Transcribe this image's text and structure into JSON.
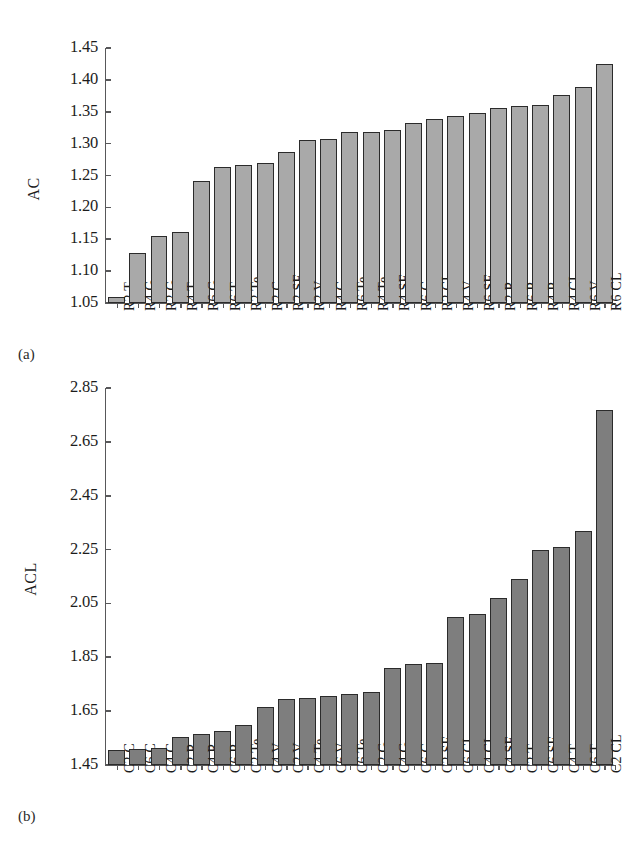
{
  "figure": {
    "panel_a_label": "(a)",
    "panel_b_label": "(b)",
    "bar_fill_a": "#a9a9a9",
    "bar_fill_b": "#7e7e7e",
    "bar_edge": "#2b2b2b",
    "axis_color": "#58585a"
  },
  "chart_data": [
    {
      "type": "bar",
      "title": "",
      "panel": "(a)",
      "xlabel": "",
      "ylabel": "AC",
      "ylim": [
        1.05,
        1.45
      ],
      "yticks": [
        "1.05",
        "1.10",
        "1.15",
        "1.20",
        "1.25",
        "1.30",
        "1.35",
        "1.40",
        "1.45"
      ],
      "grid": false,
      "legend": "none",
      "categories": [
        "R2 T",
        "R4 G",
        "R2 G",
        "R4 T",
        "R6 G",
        "R6 T",
        "R2 Te",
        "R2 C",
        "R2 SF",
        "R2 V",
        "R4 C",
        "R6 Te",
        "R4 Te",
        "R4 SF",
        "R6 C",
        "R2 CL",
        "R4 V",
        "R6 SF",
        "R2 R",
        "R6 R",
        "R4 R",
        "R4 CL",
        "R6 V",
        "R6 CL"
      ],
      "values": [
        1.06,
        1.128,
        1.155,
        1.161,
        1.241,
        1.263,
        1.266,
        1.269,
        1.287,
        1.305,
        1.307,
        1.318,
        1.319,
        1.321,
        1.333,
        1.339,
        1.344,
        1.348,
        1.356,
        1.359,
        1.361,
        1.376,
        1.389,
        1.425
      ]
    },
    {
      "type": "bar",
      "title": "",
      "panel": "(b)",
      "xlabel": "",
      "ylabel": "ACL",
      "ylim": [
        1.45,
        2.85
      ],
      "yticks": [
        "1.45",
        "1.65",
        "1.85",
        "2.05",
        "2.25",
        "2.45",
        "2.65",
        "2.85"
      ],
      "grid": false,
      "legend": "none",
      "categories": [
        "C2 C",
        "C6 C",
        "C4 C",
        "C2 R",
        "C4 R",
        "C6 R",
        "C2 Te",
        "C4 V",
        "C2 V",
        "C4 Te",
        "C6 V",
        "C6 Te",
        "C2 G",
        "C4 G",
        "C6 G",
        "C2 SF",
        "C6 CL",
        "C4 CL",
        "C4 SF",
        "C2 T",
        "C6 SF",
        "C4 T",
        "C6 T",
        "C2 CL"
      ],
      "values": [
        1.505,
        1.508,
        1.512,
        1.555,
        1.565,
        1.578,
        1.6,
        1.665,
        1.695,
        1.7,
        1.706,
        1.712,
        1.722,
        1.81,
        1.825,
        1.83,
        2.0,
        2.01,
        2.07,
        2.14,
        2.25,
        2.26,
        2.32,
        2.77
      ]
    }
  ]
}
